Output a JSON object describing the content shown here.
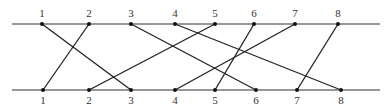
{
  "top_nodes": [
    "1",
    "2",
    "3",
    "4",
    "5",
    "6",
    "7",
    "8"
  ],
  "bottom_nodes": [
    "1",
    "2",
    "3",
    "4",
    "5",
    "6",
    "7",
    "8"
  ],
  "connections": [
    {
      "from": "1",
      "to": "3"
    },
    {
      "from": "2",
      "to": "1"
    },
    {
      "from": "3",
      "to": "6"
    },
    {
      "from": "4",
      "to": "8"
    },
    {
      "from": "5",
      "to": "2"
    },
    {
      "from": "6",
      "to": "5"
    },
    {
      "from": "7",
      "to": "4"
    },
    {
      "from": "8",
      "to": "7"
    }
  ]
}
